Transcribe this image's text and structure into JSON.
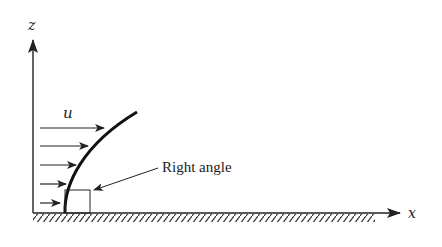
{
  "diagram": {
    "type": "boundary-layer velocity profile",
    "axes": {
      "vertical_label": "z",
      "horizontal_label": "x"
    },
    "velocity_label": "u",
    "annotation": "Right angle",
    "velocity_arrows": [
      {
        "y": 128,
        "length": 72
      },
      {
        "y": 146,
        "length": 55
      },
      {
        "y": 165,
        "length": 43
      },
      {
        "y": 184,
        "length": 33
      },
      {
        "y": 203,
        "length": 25
      }
    ],
    "colors": {
      "ink": "#222222",
      "background": "#ffffff"
    }
  }
}
